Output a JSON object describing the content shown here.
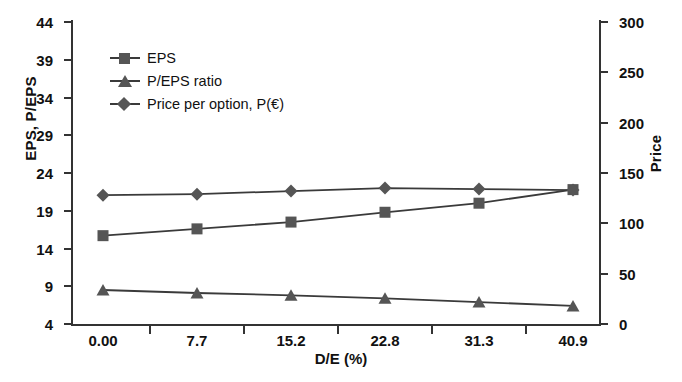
{
  "chart_data": {
    "type": "line",
    "title": "",
    "xlabel": "D/E (%)",
    "ylabel": "EPS, P/EPS",
    "ylabel_right": "Price",
    "categories": [
      "0.00",
      "7.7",
      "15.2",
      "22.8",
      "31.3",
      "40.9"
    ],
    "ylim": [
      4,
      44
    ],
    "yticks": [
      4,
      9,
      14,
      19,
      24,
      29,
      34,
      39,
      44
    ],
    "ylim_right": [
      0,
      300
    ],
    "yticks_right": [
      0,
      50,
      100,
      150,
      200,
      250,
      300
    ],
    "grid": false,
    "legend_position": "upper-left",
    "series": [
      {
        "name": "EPS",
        "marker": "square",
        "axis": "left",
        "values": [
          15.7,
          16.6,
          17.5,
          18.8,
          20.0,
          21.8
        ]
      },
      {
        "name": "P/EPS ratio",
        "marker": "triangle",
        "axis": "left",
        "values": [
          8.5,
          8.1,
          7.8,
          7.4,
          6.9,
          6.4
        ]
      },
      {
        "name": "Price per option, P(€)",
        "marker": "diamond",
        "axis": "right",
        "values": [
          128,
          129,
          132,
          135,
          134,
          133
        ]
      }
    ]
  },
  "legend": {
    "items": [
      {
        "label": "EPS"
      },
      {
        "label": "P/EPS ratio"
      },
      {
        "label": "Price per option, P(€)"
      }
    ]
  },
  "axes": {
    "left_title": "EPS, P/EPS",
    "right_title": "Price",
    "x_title": "D/E (%)",
    "left_ticks": [
      "44",
      "39",
      "34",
      "29",
      "24",
      "19",
      "14",
      "9",
      "4"
    ],
    "right_ticks": [
      "300",
      "250",
      "200",
      "150",
      "100",
      "50",
      "0"
    ],
    "x_ticks": [
      "0.00",
      "7.7",
      "15.2",
      "22.8",
      "31.3",
      "40.9"
    ]
  },
  "colors": {
    "line": "#3a3a3a",
    "marker": "#555555",
    "axis": "#333333",
    "text": "#111111"
  }
}
